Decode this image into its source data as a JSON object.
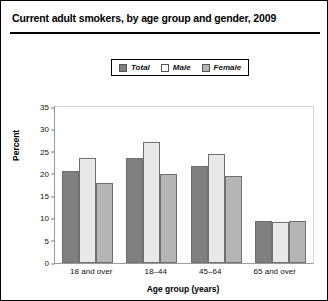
{
  "chart_data": {
    "type": "bar",
    "title": "Current adult smokers, by age group and gender, 2009",
    "xlabel": "Age group (years)",
    "ylabel": "Percent",
    "categories": [
      "18 and over",
      "18–44",
      "45–64",
      "65 and over"
    ],
    "series": [
      {
        "name": "Total",
        "color": "#808080",
        "values": [
          20.6,
          23.5,
          21.8,
          9.5
        ]
      },
      {
        "name": "Male",
        "color": "#e9e9e9",
        "values": [
          23.5,
          27.2,
          24.4,
          9.3
        ]
      },
      {
        "name": "Female",
        "color": "#b5b5b5",
        "values": [
          17.9,
          19.9,
          19.5,
          9.5
        ]
      }
    ],
    "ylim": [
      0,
      35
    ],
    "yticks": [
      "0",
      "5",
      "10",
      "15",
      "20",
      "25",
      "30",
      "35"
    ],
    "grid": false,
    "legend_position": "top-center"
  }
}
